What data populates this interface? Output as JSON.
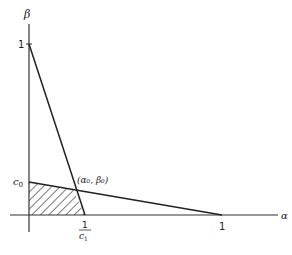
{
  "diagram": {
    "axes": {
      "y_label": "β",
      "x_label": "α"
    },
    "ticks": {
      "y_one": "1",
      "y_c0": "c",
      "y_c0_sub": "0",
      "x_one": "1",
      "x_inv_c1_num": "1",
      "x_inv_c1_den": "c",
      "x_inv_c1_den_sub": "1"
    },
    "annotation": {
      "intersection": "(α₀, β₀)"
    },
    "colors": {
      "line": "#222222",
      "hatch": "#222222",
      "background": "#ffffff"
    }
  }
}
